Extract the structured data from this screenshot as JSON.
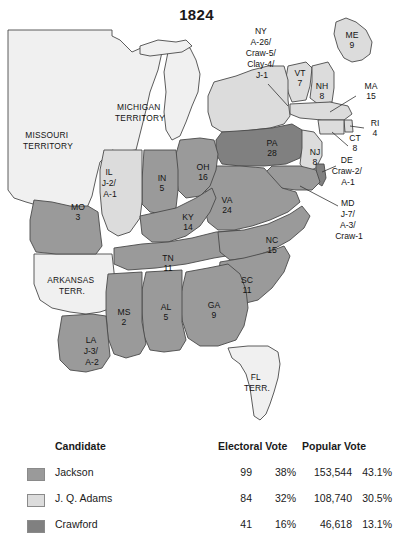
{
  "title": "1824",
  "map": {
    "colors": {
      "jackson": "#9a9a9a",
      "adams": "#dcdcdc",
      "crawford": "#808080",
      "territory": "#f0f0f0",
      "water": "#ffffff",
      "border": "#4a4a4a"
    },
    "states": [
      {
        "code": "ME",
        "label": "ME",
        "votes": "9",
        "x": 352,
        "y": 40
      },
      {
        "code": "VT",
        "label": "VT",
        "votes": "7",
        "x": 300,
        "y": 78
      },
      {
        "code": "NH",
        "label": "NH",
        "votes": "8",
        "x": 322,
        "y": 91
      },
      {
        "code": "MA",
        "label": "MA",
        "votes": "15",
        "x": 371,
        "y": 91
      },
      {
        "code": "RI",
        "label": "RI",
        "votes": "4",
        "x": 375,
        "y": 128
      },
      {
        "code": "CT",
        "label": "CT",
        "votes": "8",
        "x": 355,
        "y": 139
      },
      {
        "code": "NY",
        "label": "NY",
        "votes": "A-26/ Craw-5/ Clay-4/ J-1",
        "x": 262,
        "y": 42
      },
      {
        "code": "PA",
        "label": "PA",
        "votes": "28",
        "x": 272,
        "y": 148
      },
      {
        "code": "NJ",
        "label": "NJ",
        "votes": "8",
        "x": 315,
        "y": 157
      },
      {
        "code": "DE",
        "label": "DE",
        "votes": "Craw-2/ A-1",
        "x": 348,
        "y": 165
      },
      {
        "code": "MD",
        "label": "MD",
        "votes": "J-7/ A-3/ Craw-1",
        "x": 349,
        "y": 208
      },
      {
        "code": "VA",
        "label": "VA",
        "votes": "24",
        "x": 227,
        "y": 205
      },
      {
        "code": "OH",
        "label": "OH",
        "votes": "16",
        "x": 203,
        "y": 172
      },
      {
        "code": "IN",
        "label": "IN",
        "votes": "5",
        "x": 162,
        "y": 183
      },
      {
        "code": "IL",
        "label": "IL",
        "votes": "J-2/ A-1",
        "x": 110,
        "y": 177
      },
      {
        "code": "KY",
        "label": "KY",
        "votes": "14",
        "x": 188,
        "y": 222
      },
      {
        "code": "MO",
        "label": "MO",
        "votes": "3",
        "x": 78,
        "y": 212
      },
      {
        "code": "TN",
        "label": "TN",
        "votes": "11",
        "x": 168,
        "y": 263
      },
      {
        "code": "NC",
        "label": "NC",
        "votes": "15",
        "x": 272,
        "y": 245
      },
      {
        "code": "SC",
        "label": "SC",
        "votes": "11",
        "x": 247,
        "y": 285
      },
      {
        "code": "GA",
        "label": "GA",
        "votes": "9",
        "x": 214,
        "y": 310
      },
      {
        "code": "AL",
        "label": "AL",
        "votes": "5",
        "x": 166,
        "y": 312
      },
      {
        "code": "MS",
        "label": "MS",
        "votes": "2",
        "x": 124,
        "y": 317
      },
      {
        "code": "LA",
        "label": "LA",
        "votes": "J-3/ A-2",
        "x": 92,
        "y": 345
      }
    ],
    "territories": [
      {
        "code": "MISSOURI-TERRITORY",
        "line1": "MISSOURI",
        "line2": "TERRITORY",
        "x": 48,
        "y": 140
      },
      {
        "code": "MICHIGAN-TERRITORY",
        "line1": "MICHIGAN",
        "line2": "TERRITORY",
        "x": 140,
        "y": 112
      },
      {
        "code": "ARKANSAS-TERRITORY",
        "line1": "ARKANSAS",
        "line2": "TERR.",
        "x": 72,
        "y": 285
      },
      {
        "code": "FLORIDA-TERRITORY",
        "line1": "FL",
        "line2": "TERR.",
        "x": 257,
        "y": 382
      }
    ]
  },
  "legend": {
    "headers": {
      "candidate": "Candidate",
      "electoral_vote": "Electoral Vote",
      "popular_vote": "Popular Vote"
    },
    "rows": [
      {
        "name": "Jackson",
        "swatch": "#9a9a9a",
        "electoral": "99",
        "electoral_pct": "38%",
        "popular": "153,544",
        "popular_pct": "43.1%"
      },
      {
        "name": "J. Q. Adams",
        "swatch": "#dcdcdc",
        "electoral": "84",
        "electoral_pct": "32%",
        "popular": "108,740",
        "popular_pct": "30.5%"
      },
      {
        "name": "Crawford",
        "swatch": "#808080",
        "electoral": "41",
        "electoral_pct": "16%",
        "popular": "46,618",
        "popular_pct": "13.1%"
      }
    ]
  }
}
